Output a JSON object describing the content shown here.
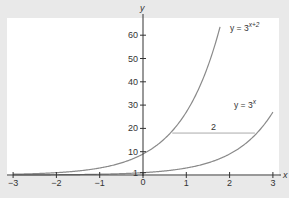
{
  "chart_data": {
    "type": "line",
    "title": "",
    "xlabel": "x",
    "ylabel": "y",
    "xlim": [
      -3,
      3
    ],
    "ylim": [
      0,
      65
    ],
    "x_ticks": [
      -3,
      -2,
      -1,
      0,
      1,
      2,
      3
    ],
    "x_tick_labels": [
      "−3",
      "−2",
      "−1",
      "0",
      "1",
      "2",
      "3"
    ],
    "y_ticks": [
      1,
      10,
      20,
      30,
      40,
      50,
      60
    ],
    "y_tick_labels": [
      "1",
      "10",
      "20",
      "30",
      "40",
      "50",
      "60"
    ],
    "grid": false,
    "series": [
      {
        "name": "y = 3^(x+2)",
        "label_base": "y = 3",
        "label_exp": "x+2",
        "x": [
          -3,
          -2.5,
          -2,
          -1.5,
          -1,
          -0.5,
          0,
          0.5,
          1,
          1.5,
          1.77
        ],
        "values": [
          0.33,
          0.58,
          1,
          1.73,
          3,
          5.2,
          9,
          15.6,
          27,
          46.8,
          63.2
        ]
      },
      {
        "name": "y = 3^x",
        "label_base": "y = 3",
        "label_exp": "x",
        "x": [
          -3,
          -2,
          -1,
          0,
          0.5,
          1,
          1.5,
          2,
          2.5,
          3
        ],
        "values": [
          0.04,
          0.11,
          0.33,
          1,
          1.73,
          3,
          5.2,
          9,
          15.6,
          27
        ]
      }
    ],
    "annotations": [
      {
        "type": "horizontal-segment",
        "y": 18,
        "x_from": 0.63,
        "x_to": 2.63,
        "label": "2"
      }
    ],
    "colors": {
      "curve": "#8a8a8a",
      "axis": "#333333",
      "panel": "#ffffff",
      "background": "#e9e9e9",
      "annotation": "#aaaaaa"
    }
  }
}
